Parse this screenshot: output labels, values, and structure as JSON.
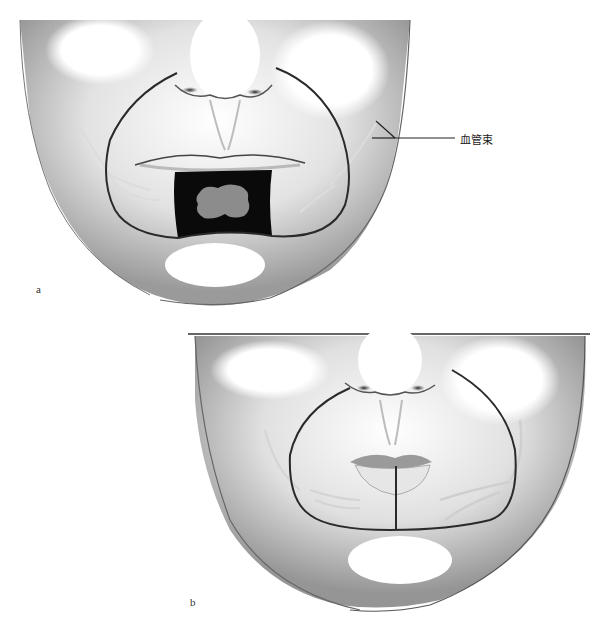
{
  "figure": {
    "panels": [
      {
        "id": "a",
        "label": "a",
        "description": "Lower face with black rectangular excision area over lower lip containing gray lesion; outlined flap region",
        "callout": {
          "text": "血管束",
          "meaning": "vascular bundle"
        }
      },
      {
        "id": "b",
        "label": "b",
        "description": "Lower face after reconstruction with vertical midline closure line on lower lip within outlined flap region"
      }
    ],
    "colors": {
      "skin_shade": "#8a8a8a",
      "outline": "#2a2a2a",
      "excision": "#0a0a0a",
      "lesion": "#8c8c8c",
      "vessels": "#d8d8d8"
    }
  }
}
